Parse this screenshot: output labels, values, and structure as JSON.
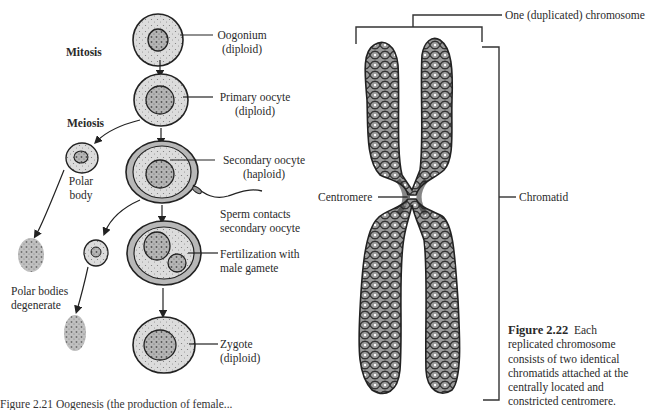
{
  "figure_2_21": {
    "process_labels": {
      "mitosis": "Mitosis",
      "meiosis": "Meiosis"
    },
    "stages": [
      {
        "id": "oogonium",
        "line1": "Oogonium",
        "line2": "(diploid)"
      },
      {
        "id": "primary-oocyte",
        "line1": "Primary oocyte",
        "line2": "(diploid)"
      },
      {
        "id": "secondary-oocyte",
        "line1": "Secondary oocyte",
        "line2": "(haploid)"
      },
      {
        "id": "sperm-contact",
        "line1": "Sperm contacts",
        "line2": "secondary oocyte"
      },
      {
        "id": "fertilization",
        "line1": "Fertilization with",
        "line2": "male gamete"
      },
      {
        "id": "zygote",
        "line1": "Zygote",
        "line2": "(diploid)"
      }
    ],
    "polar_body": {
      "line1": "Polar",
      "line2": "body"
    },
    "polar_bodies_degenerate": {
      "line1": "Polar bodies",
      "line2": "degenerate"
    },
    "caption_cutoff": "Figure 2.21 Oogenesis (the production of female..."
  },
  "figure_2_22": {
    "labels": {
      "chromosome": "One (duplicated) chromosome",
      "centromere": "Centromere",
      "chromatid": "Chromatid"
    },
    "caption": {
      "figure_number": "Figure 2.22",
      "lines": [
        "Each",
        "replicated chromosome",
        "consists of two identical",
        "chromatids attached at the",
        "centrally located and",
        "constricted centromere."
      ]
    }
  },
  "colors": {
    "ink": "#2a2a2a",
    "cell_fill": "#d9d9d9",
    "nucleus_fill": "#bdbdbd",
    "chromatin": "#8a8a8a"
  }
}
